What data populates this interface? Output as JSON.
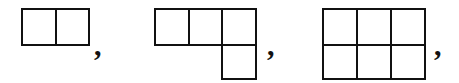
{
  "diagram": {
    "line_color": "#111111",
    "cell_size_px": 34,
    "figures": [
      {
        "name": "domino",
        "cells": [
          [
            0,
            0
          ],
          [
            0,
            1
          ]
        ],
        "origin": [
          21,
          8
        ],
        "separator": ","
      },
      {
        "name": "L-tetromino",
        "cells": [
          [
            0,
            0
          ],
          [
            0,
            1
          ],
          [
            0,
            2
          ],
          [
            1,
            2
          ]
        ],
        "origin": [
          154,
          8
        ],
        "separator": ","
      },
      {
        "name": "2x3-rectangle",
        "cells": [
          [
            0,
            0
          ],
          [
            0,
            1
          ],
          [
            0,
            2
          ],
          [
            1,
            0
          ],
          [
            1,
            1
          ],
          [
            1,
            2
          ]
        ],
        "origin": [
          322,
          8
        ],
        "separator": ","
      }
    ]
  }
}
